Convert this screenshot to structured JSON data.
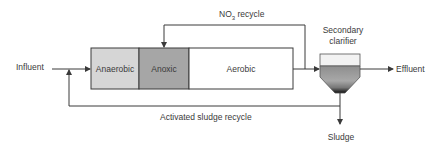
{
  "diagram": {
    "type": "process-flow"
  },
  "labels": {
    "influent": "Influent",
    "effluent": "Effluent",
    "sludge": "Sludge",
    "no3_recycle_prefix": "NO",
    "no3_recycle_sub": "3",
    "no3_recycle_suffix": " recycle",
    "activated_sludge_recycle": "Activated sludge recycle",
    "clarifier_line1": "Secondary",
    "clarifier_line2": "clarifier"
  },
  "zones": [
    {
      "name": "Anaerobic",
      "fill": "#d6d6d6"
    },
    {
      "name": "Anoxic",
      "fill": "#a6a6a6"
    },
    {
      "name": "Aerobic",
      "fill": "#ffffff"
    }
  ],
  "colors": {
    "line": "#3a3a3a",
    "clarifier_top": "#f2f2f2",
    "clarifier_mid": "#9a9a9a",
    "clarifier_bottom": "#111111"
  }
}
